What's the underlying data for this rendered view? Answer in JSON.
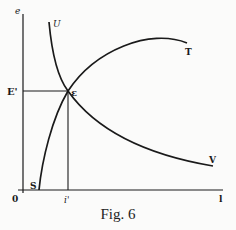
{
  "figure": {
    "caption": "Fig. 6",
    "axis_labels": {
      "y_axis": "e",
      "origin": "0",
      "x_end": "l",
      "y_marker": "E'",
      "x_marker": "i'"
    },
    "curve_labels": {
      "U": "U",
      "T": "T",
      "V": "V",
      "S": "S",
      "intersection": "ε"
    },
    "colors": {
      "ink": "#1a1a1a",
      "background": "#fbfbfa"
    }
  }
}
